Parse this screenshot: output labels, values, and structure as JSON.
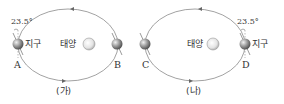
{
  "panels": [
    {
      "id": "ga",
      "caption": "(가)",
      "sun_label": "태양",
      "earth_label": "지구",
      "tilt_label": "23.5°",
      "positions": [
        {
          "letter": "A",
          "side": "left",
          "has_earth_label": true
        },
        {
          "letter": "B",
          "side": "right",
          "has_earth_label": false
        }
      ],
      "orbit_direction": "counterclockwise"
    },
    {
      "id": "na",
      "caption": "(나)",
      "sun_label": "태양",
      "earth_label": "지구",
      "tilt_label": "23.5°",
      "positions": [
        {
          "letter": "C",
          "side": "left",
          "has_earth_label": false
        },
        {
          "letter": "D",
          "side": "right",
          "has_earth_label": true
        }
      ],
      "orbit_direction": "counterclockwise"
    }
  ],
  "colors": {
    "orbit": "#8a8a8a",
    "earth": "#9a9a9a",
    "sun": "#d8d8d8",
    "text": "#333333"
  }
}
